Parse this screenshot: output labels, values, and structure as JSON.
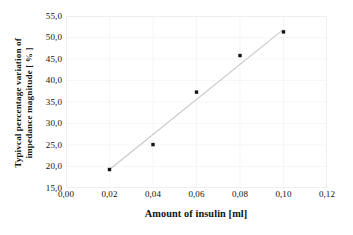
{
  "chart_data": {
    "type": "scatter",
    "title": "",
    "subtitle": "",
    "xlabel": "Amount of insulin [ml]",
    "ylabel": "Typivcal percentage variation of impedance magnitude [ % ]",
    "ylabel_line1": "Typivcal percentage variation of",
    "ylabel_line2": "impedance magnitude [ % ]",
    "x": [
      0.02,
      0.04,
      0.06,
      0.08,
      0.1
    ],
    "values": [
      19.3,
      25.1,
      37.3,
      45.8,
      51.3
    ],
    "series": [
      {
        "name": "Typical percentage variation of impedance magnitude",
        "x": [
          0.02,
          0.04,
          0.06,
          0.08,
          0.1
        ],
        "values": [
          19.3,
          25.1,
          37.3,
          45.8,
          51.3
        ],
        "marker": "square",
        "marker_color": "#151515"
      }
    ],
    "trendline": {
      "type": "linear",
      "x": [
        0.02,
        0.1
      ],
      "values": [
        19.3,
        51.9
      ],
      "color": "#c8c8c8"
    },
    "xlim": [
      0.0,
      0.12
    ],
    "ylim": [
      15.0,
      55.0
    ],
    "xticks": [
      0.0,
      0.02,
      0.04,
      0.06,
      0.08,
      0.1,
      0.12
    ],
    "yticks": [
      15.0,
      20.0,
      25.0,
      30.0,
      35.0,
      40.0,
      45.0,
      50.0,
      55.0
    ],
    "xticklabels": [
      "0,00",
      "0,02",
      "0,04",
      "0,06",
      "0,08",
      "0,10",
      "0,12"
    ],
    "yticklabels": [
      "15,0",
      "20,0",
      "25,0",
      "30,0",
      "35,0",
      "40,0",
      "45,0",
      "50,0",
      "55,0"
    ],
    "grid": true,
    "grid_color": "#f2f2f2",
    "legend": false,
    "legend_position": "none",
    "frame_color": "#ededed",
    "background": "#ffffff",
    "decimal_separator": ","
  }
}
